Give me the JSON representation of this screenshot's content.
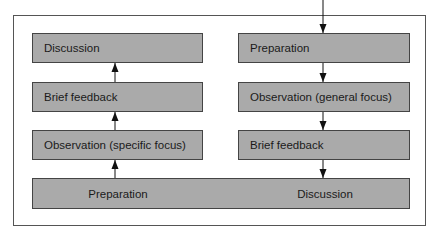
{
  "diagram": {
    "type": "flow",
    "left_column": {
      "direction": "up",
      "boxes": [
        {
          "label": "Discussion"
        },
        {
          "label": "Brief feedback"
        },
        {
          "label": "Observation (specific focus)"
        }
      ]
    },
    "right_column": {
      "direction": "down",
      "boxes": [
        {
          "label": "Preparation"
        },
        {
          "label": "Observation (general focus)"
        },
        {
          "label": "Brief feedback"
        }
      ]
    },
    "bottom_box": {
      "left_label": "Preparation",
      "right_label": "Discussion"
    },
    "colors": {
      "box_fill": "#c8c8c8",
      "border": "#444444",
      "text": "#1a1a1a"
    }
  }
}
